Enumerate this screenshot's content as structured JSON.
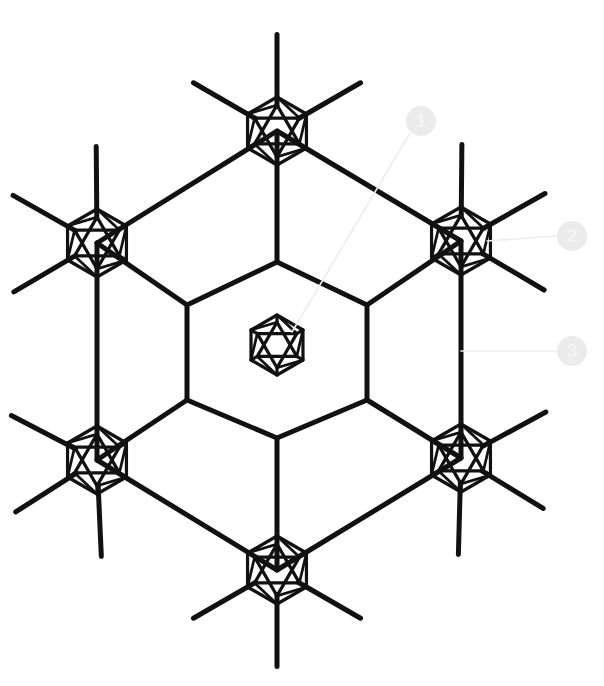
{
  "figure": {
    "title": "",
    "background_color": "#ffffff",
    "stroke_color": "#111111",
    "callout_color": "#ebebeb",
    "callout_text_color": "#f4f4f4",
    "leader_color": "#ededed",
    "width": 604,
    "height": 686
  },
  "chart_data": {
    "type": "diagram",
    "subtype": "hexagonal-lattice-node-graph",
    "title": "",
    "center": {
      "x": 277,
      "y": 345
    },
    "nodes": [
      {
        "id": "center",
        "label": "central-node",
        "x": 277,
        "y": 345,
        "radius": 30,
        "type": "cluster"
      },
      {
        "id": "n-top",
        "label": "top-node",
        "x": 277,
        "y": 131,
        "radius": 34,
        "type": "cluster"
      },
      {
        "id": "n-upper-right",
        "label": "upper-right-node",
        "x": 461,
        "y": 241,
        "radius": 34,
        "type": "cluster"
      },
      {
        "id": "n-lower-right",
        "label": "lower-right-node",
        "x": 461,
        "y": 458,
        "radius": 34,
        "type": "cluster"
      },
      {
        "id": "n-bottom",
        "label": "bottom-node",
        "x": 277,
        "y": 570,
        "radius": 34,
        "type": "cluster"
      },
      {
        "id": "n-lower-left",
        "label": "lower-left-node",
        "x": 97,
        "y": 460,
        "radius": 34,
        "type": "cluster"
      },
      {
        "id": "n-upper-left",
        "label": "upper-left-node",
        "x": 97,
        "y": 243,
        "radius": 34,
        "type": "cluster"
      }
    ],
    "inner_hexagon_vertices": [
      {
        "x": 277,
        "y": 262
      },
      {
        "x": 367,
        "y": 305
      },
      {
        "x": 367,
        "y": 400
      },
      {
        "x": 277,
        "y": 438
      },
      {
        "x": 187,
        "y": 400
      },
      {
        "x": 187,
        "y": 305
      }
    ],
    "outer_hexagon_vertices": [
      {
        "x": 277,
        "y": 131
      },
      {
        "x": 461,
        "y": 241
      },
      {
        "x": 461,
        "y": 458
      },
      {
        "x": 277,
        "y": 570
      },
      {
        "x": 97,
        "y": 460
      },
      {
        "x": 97,
        "y": 243
      }
    ],
    "radial_spokes": [
      {
        "from": {
          "x": 277,
          "y": 262
        },
        "to": {
          "x": 277,
          "y": 131
        }
      },
      {
        "from": {
          "x": 367,
          "y": 305
        },
        "to": {
          "x": 461,
          "y": 241
        }
      },
      {
        "from": {
          "x": 367,
          "y": 400
        },
        "to": {
          "x": 461,
          "y": 458
        }
      },
      {
        "from": {
          "x": 277,
          "y": 438
        },
        "to": {
          "x": 277,
          "y": 570
        }
      },
      {
        "from": {
          "x": 187,
          "y": 400
        },
        "to": {
          "x": 97,
          "y": 460
        }
      },
      {
        "from": {
          "x": 187,
          "y": 305
        },
        "to": {
          "x": 97,
          "y": 243
        }
      }
    ],
    "terminal_bond_count_per_node": 3,
    "terminal_bond_length": 72,
    "node_internal_motif": "hexagon-with-inscribed-hexagram",
    "symmetry": "6-fold",
    "stroke_width_main": 5,
    "stroke_width_node": 3.2
  },
  "callouts": [
    {
      "id": "callout-1",
      "number": "1",
      "badge": {
        "cx": 421,
        "cy": 121,
        "r": 15
      },
      "leader": {
        "x1": 410,
        "y1": 133,
        "x2": 292,
        "y2": 332
      },
      "points_to": "central-node"
    },
    {
      "id": "callout-2",
      "number": "2",
      "badge": {
        "cx": 572,
        "cy": 236,
        "r": 15
      },
      "leader": {
        "x1": 556,
        "y1": 236,
        "x2": 487,
        "y2": 241
      },
      "points_to": "upper-right-node"
    },
    {
      "id": "callout-3",
      "number": "3",
      "badge": {
        "cx": 572,
        "cy": 351,
        "r": 15
      },
      "leader": {
        "x1": 556,
        "y1": 351,
        "x2": 461,
        "y2": 351
      },
      "points_to": "outer-hexagon-edge"
    }
  ]
}
